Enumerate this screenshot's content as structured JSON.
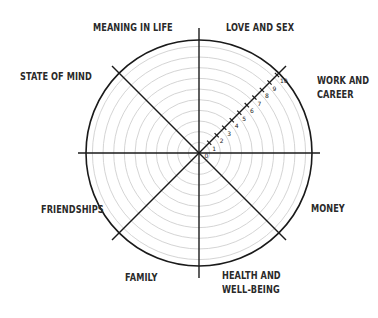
{
  "diagram": {
    "type": "wheel-of-life",
    "center": {
      "x": 199,
      "y": 153
    },
    "outer_radius": 113,
    "ring_count": 10,
    "colors": {
      "outer_ring": "#1a1a1a",
      "spokes": "#1a1a1a",
      "inner_rings": "#cfcfcf",
      "text": "#2a2a2a"
    },
    "scale": {
      "axis": "north-east diagonal",
      "ticks": [
        "0",
        "1",
        "2",
        "3",
        "4",
        "5",
        "6",
        "7",
        "8",
        "9",
        "10"
      ]
    },
    "segments": [
      {
        "id": "meaning",
        "lines": [
          "MEANING IN LIFE"
        ]
      },
      {
        "id": "love",
        "lines": [
          "LOVE AND SEX"
        ]
      },
      {
        "id": "work",
        "lines": [
          "WORK AND",
          "CAREER"
        ]
      },
      {
        "id": "money",
        "lines": [
          "MONEY"
        ]
      },
      {
        "id": "health",
        "lines": [
          "HEALTH AND",
          "WELL-BEING"
        ]
      },
      {
        "id": "family",
        "lines": [
          "FAMILY"
        ]
      },
      {
        "id": "friendships",
        "lines": [
          "FRIENDSHIPS"
        ]
      },
      {
        "id": "state",
        "lines": [
          "STATE OF MIND"
        ]
      }
    ]
  }
}
